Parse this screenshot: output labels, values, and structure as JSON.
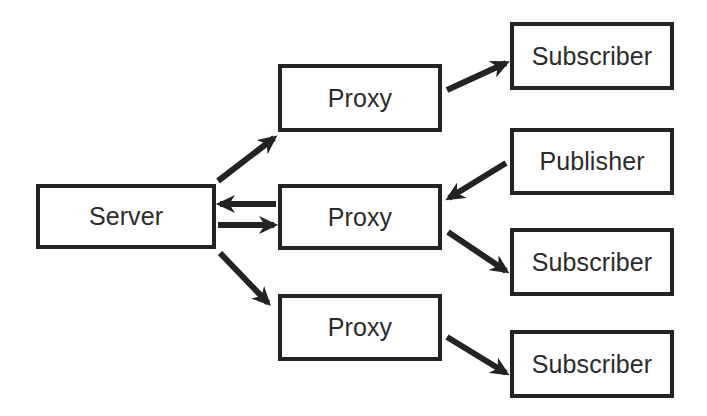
{
  "diagram": {
    "type": "block-diagram",
    "canvas": {
      "width": 707,
      "height": 416
    },
    "style": {
      "background_color": "#ffffff",
      "box_fill_color": "#ffffff",
      "box_border_color": "#232323",
      "box_border_width": 4,
      "text_color": "#2b2b2b",
      "arrow_color": "#232323",
      "arrow_width": 6
    },
    "nodes": [
      {
        "id": "server",
        "label": "Server",
        "x": 36,
        "y": 184,
        "width": 180,
        "height": 65
      },
      {
        "id": "proxy-top",
        "label": "Proxy",
        "x": 278,
        "y": 64,
        "width": 164,
        "height": 68
      },
      {
        "id": "proxy-middle",
        "label": "Proxy",
        "x": 278,
        "y": 184,
        "width": 164,
        "height": 66
      },
      {
        "id": "proxy-bottom",
        "label": "Proxy",
        "x": 278,
        "y": 294,
        "width": 164,
        "height": 67
      },
      {
        "id": "subscriber-top",
        "label": "Subscriber",
        "x": 510,
        "y": 22,
        "width": 164,
        "height": 68
      },
      {
        "id": "publisher",
        "label": "Publisher",
        "x": 510,
        "y": 128,
        "width": 164,
        "height": 67
      },
      {
        "id": "subscriber-middle",
        "label": "Subscriber",
        "x": 510,
        "y": 228,
        "width": 164,
        "height": 68
      },
      {
        "id": "subscriber-bottom",
        "label": "Subscriber",
        "x": 510,
        "y": 330,
        "width": 164,
        "height": 68
      }
    ],
    "edges": [
      {
        "id": "server-to-proxy-top",
        "from": "server",
        "to": "proxy-top",
        "x1": 218,
        "y1": 181,
        "x2": 274,
        "y2": 138
      },
      {
        "id": "proxy-middle-to-server",
        "from": "proxy-middle",
        "to": "server",
        "x1": 276,
        "y1": 204,
        "x2": 220,
        "y2": 204
      },
      {
        "id": "server-to-proxy-middle",
        "from": "server",
        "to": "proxy-middle",
        "x1": 218,
        "y1": 225,
        "x2": 274,
        "y2": 225
      },
      {
        "id": "server-to-proxy-bottom",
        "from": "server",
        "to": "proxy-bottom",
        "x1": 220,
        "y1": 253,
        "x2": 268,
        "y2": 303
      },
      {
        "id": "proxy-top-to-subscriber",
        "from": "proxy-top",
        "to": "subscriber-top",
        "x1": 447,
        "y1": 90,
        "x2": 506,
        "y2": 63
      },
      {
        "id": "publisher-to-proxy-middle",
        "from": "publisher",
        "to": "proxy-middle",
        "x1": 506,
        "y1": 163,
        "x2": 449,
        "y2": 198
      },
      {
        "id": "proxy-middle-to-subscriber",
        "from": "proxy-middle",
        "to": "subscriber-middle",
        "x1": 448,
        "y1": 232,
        "x2": 506,
        "y2": 271
      },
      {
        "id": "proxy-bottom-to-subscriber",
        "from": "proxy-bottom",
        "to": "subscriber-bottom",
        "x1": 447,
        "y1": 337,
        "x2": 506,
        "y2": 373
      }
    ]
  }
}
